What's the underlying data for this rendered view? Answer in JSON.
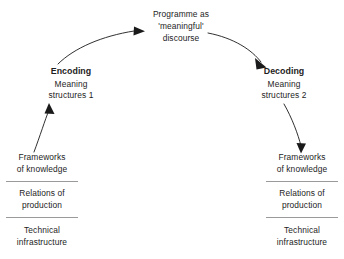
{
  "diagram": {
    "background_color": "#ffffff",
    "line_color": "#1a1a1a",
    "rule_color": "#9a9a9a",
    "discourse": {
      "line1": "Programme as",
      "line2": "'meaningful'",
      "line3": "discourse"
    },
    "encoding": {
      "title": "Encoding",
      "line1": "Meaning",
      "line2": "structures 1"
    },
    "decoding": {
      "title": "Decoding",
      "line1": "Meaning",
      "line2": "structures 2"
    },
    "stack_left": {
      "cells": [
        {
          "line1": "Frameworks",
          "line2": "of knowledge"
        },
        {
          "line1": "Relations of",
          "line2": "production"
        },
        {
          "line1": "Technical",
          "line2": "infrastructure"
        }
      ]
    },
    "stack_right": {
      "cells": [
        {
          "line1": "Frameworks",
          "line2": "of knowledge"
        },
        {
          "line1": "Relations of",
          "line2": "production"
        },
        {
          "line1": "Technical",
          "line2": "infrastructure"
        }
      ]
    },
    "arrows": [
      {
        "name": "encoding-to-discourse",
        "direction": "up-right"
      },
      {
        "name": "discourse-to-decoding",
        "direction": "down-right"
      },
      {
        "name": "frameworks-to-encoding",
        "direction": "up"
      },
      {
        "name": "decoding-to-frameworks",
        "direction": "down"
      }
    ]
  }
}
